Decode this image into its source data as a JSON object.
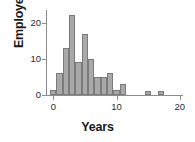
{
  "chart_data": {
    "type": "bar",
    "title": "",
    "xlabel": "Years",
    "ylabel": "Employees",
    "xlim": [
      -1,
      20.5
    ],
    "ylim": [
      0,
      23.5
    ],
    "grid": false,
    "legend": null,
    "bin_width": 1,
    "xticks": [
      0,
      10,
      20
    ],
    "xtick_labels": [
      "0",
      "10",
      "20"
    ],
    "yticks": [
      0,
      10,
      20
    ],
    "ytick_labels": [
      "0",
      "10",
      "20"
    ],
    "bar_color": "#a9a9a9",
    "bar_edge_color": "#7b7b7b",
    "axis_color": "#8d8d8d",
    "bins": [
      {
        "x0": -0.5,
        "x1": 0.5,
        "value": 1.5
      },
      {
        "x0": 0.5,
        "x1": 1.5,
        "value": 6
      },
      {
        "x0": 1.5,
        "x1": 2.5,
        "value": 13
      },
      {
        "x0": 2.5,
        "x1": 3.5,
        "value": 22
      },
      {
        "x0": 3.5,
        "x1": 4.5,
        "value": 9
      },
      {
        "x0": 4.5,
        "x1": 5.5,
        "value": 17
      },
      {
        "x0": 5.5,
        "x1": 6.5,
        "value": 10
      },
      {
        "x0": 6.5,
        "x1": 7.5,
        "value": 5
      },
      {
        "x0": 7.5,
        "x1": 8.5,
        "value": 5
      },
      {
        "x0": 8.5,
        "x1": 9.5,
        "value": 6
      },
      {
        "x0": 9.5,
        "x1": 10.5,
        "value": 1.5
      },
      {
        "x0": 10.5,
        "x1": 11.5,
        "value": 3
      },
      {
        "x0": 14.5,
        "x1": 15.5,
        "value": 1
      },
      {
        "x0": 16.5,
        "x1": 17.5,
        "value": 1
      }
    ],
    "categories": [
      "0",
      "1",
      "2",
      "3",
      "4",
      "5",
      "6",
      "7",
      "8",
      "9",
      "10",
      "11",
      "15",
      "17"
    ],
    "values": [
      1.5,
      6,
      13,
      22,
      9,
      17,
      10,
      5,
      5,
      6,
      1.5,
      3,
      1,
      1
    ]
  }
}
